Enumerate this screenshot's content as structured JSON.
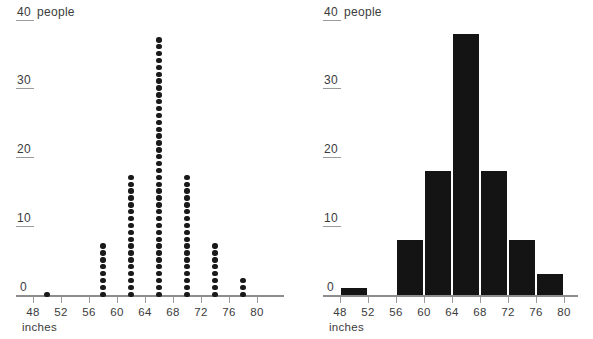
{
  "chart_data": [
    {
      "type": "scatter",
      "id": "dot-plot",
      "title": "",
      "xlabel": "inches",
      "ylabel": "people",
      "y_unit_label": "people",
      "xlim": [
        46,
        82
      ],
      "ylim": [
        0,
        40
      ],
      "x_ticks": [
        48,
        52,
        56,
        60,
        64,
        68,
        72,
        76,
        80
      ],
      "y_ticks": [
        0,
        10,
        20,
        30,
        40
      ],
      "grid": false,
      "legend": "none",
      "dot_unit": 1,
      "categories": [
        50,
        58,
        62,
        66,
        70,
        74,
        78
      ],
      "values": [
        1,
        8,
        18,
        38,
        18,
        8,
        3
      ]
    },
    {
      "type": "bar",
      "id": "histogram",
      "title": "",
      "xlabel": "inches",
      "ylabel": "people",
      "y_unit_label": "people",
      "xlim": [
        46,
        82
      ],
      "ylim": [
        0,
        40
      ],
      "x_ticks": [
        48,
        52,
        56,
        60,
        64,
        68,
        72,
        76,
        80
      ],
      "y_ticks": [
        0,
        10,
        20,
        30,
        40
      ],
      "grid": false,
      "legend": "none",
      "bins": [
        {
          "label": "48-52",
          "start": 48,
          "end": 52,
          "value": 1
        },
        {
          "label": "56-60",
          "start": 56,
          "end": 60,
          "value": 8
        },
        {
          "label": "60-64",
          "start": 60,
          "end": 64,
          "value": 18
        },
        {
          "label": "64-68",
          "start": 64,
          "end": 68,
          "value": 38
        },
        {
          "label": "68-72",
          "start": 68,
          "end": 72,
          "value": 18
        },
        {
          "label": "72-76",
          "start": 72,
          "end": 76,
          "value": 8
        },
        {
          "label": "76-80",
          "start": 76,
          "end": 80,
          "value": 3
        }
      ],
      "categories": [
        "48-52",
        "56-60",
        "60-64",
        "64-68",
        "68-72",
        "72-76",
        "76-80"
      ],
      "values": [
        1,
        8,
        18,
        38,
        18,
        8,
        3
      ]
    }
  ],
  "colors": {
    "mark": "#1a1a1a",
    "bar": "#141414",
    "axis": "#8d8d8d",
    "text": "#3b3b3b",
    "background": "#ffffff"
  },
  "left_panel": {
    "y_axis_top_label": "40",
    "y_axis_unit": "people",
    "y_labels": [
      "40",
      "30",
      "20",
      "10",
      "0"
    ],
    "x_labels": [
      "48",
      "52",
      "56",
      "60",
      "64",
      "68",
      "72",
      "76",
      "80"
    ],
    "x_title": "inches"
  },
  "right_panel": {
    "y_axis_top_label": "40",
    "y_axis_unit": "people",
    "y_labels": [
      "40",
      "30",
      "20",
      "10",
      "0"
    ],
    "x_labels": [
      "48",
      "52",
      "56",
      "60",
      "64",
      "68",
      "72",
      "76",
      "80"
    ],
    "x_title": "inches"
  }
}
